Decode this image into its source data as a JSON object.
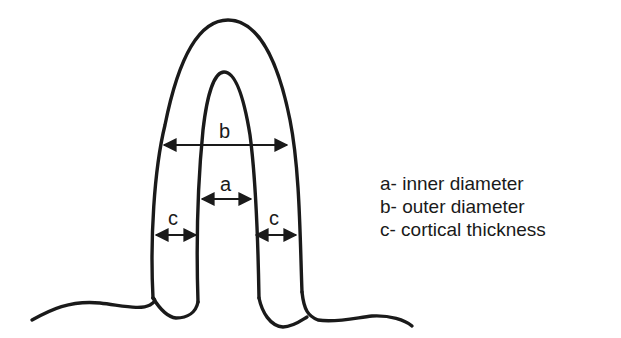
{
  "diagram": {
    "type": "cross-section schematic",
    "labels": {
      "a": "a",
      "b": "b",
      "c_left": "c",
      "c_right": "c"
    },
    "legend": [
      {
        "key": "a",
        "text": "a- inner diameter"
      },
      {
        "key": "b",
        "text": "b- outer diameter"
      },
      {
        "key": "c",
        "text": "c- cortical thickness"
      }
    ],
    "colors": {
      "stroke": "#1a1a1a",
      "background": "#ffffff"
    }
  }
}
